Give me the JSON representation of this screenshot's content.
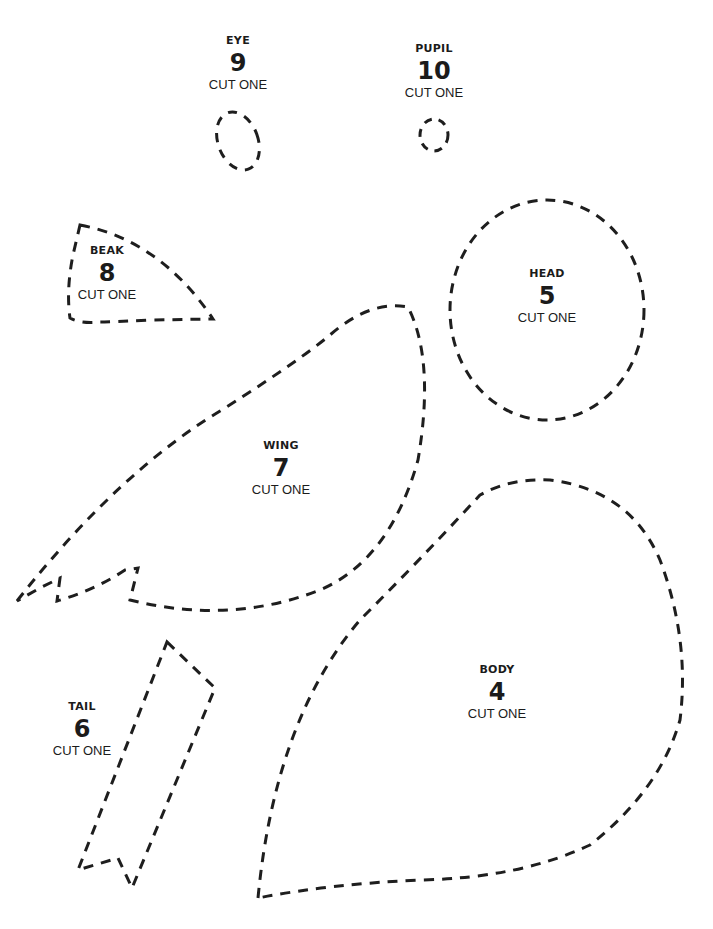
{
  "pieces": [
    {
      "id": "eye",
      "name": "EYE",
      "number": "9",
      "instruction": "CUT ONE"
    },
    {
      "id": "pupil",
      "name": "PUPIL",
      "number": "10",
      "instruction": "CUT ONE"
    },
    {
      "id": "beak",
      "name": "BEAK",
      "number": "8",
      "instruction": "CUT ONE"
    },
    {
      "id": "head",
      "name": "HEAD",
      "number": "5",
      "instruction": "CUT ONE"
    },
    {
      "id": "wing",
      "name": "WING",
      "number": "7",
      "instruction": "CUT ONE"
    },
    {
      "id": "tail",
      "name": "TAIL",
      "number": "6",
      "instruction": "CUT ONE"
    },
    {
      "id": "body",
      "name": "BODY",
      "number": "4",
      "instruction": "CUT ONE"
    }
  ],
  "colors": {
    "line": "#1e1e1e",
    "background": "#ffffff"
  }
}
